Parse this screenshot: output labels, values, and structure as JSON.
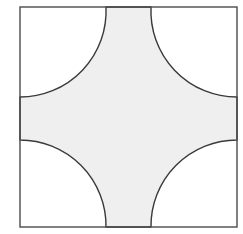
{
  "figure": {
    "title": "Square with four corner quarter-circle arcs",
    "background_color": "#ffffff",
    "shaded_fill_color": "#efefef",
    "stroke_color": "#3a3a3a",
    "frame_stroke_color": "#4a4a4a",
    "stroke_width": 1.4,
    "frame_stroke_width": 1.4,
    "square": {
      "left": 20,
      "top": 7,
      "right": 237,
      "bottom": 227,
      "width": 217,
      "height": 220,
      "label": "bounding-square"
    },
    "arcs": [
      {
        "name": "top-left-arc",
        "center_x": 20,
        "center_y": 7,
        "radius": 86,
        "start_x": 106,
        "start_y": 7,
        "end_x": 20,
        "end_y": 97
      },
      {
        "name": "top-right-arc",
        "center_x": 237,
        "center_y": 7,
        "radius": 86,
        "start_x": 151,
        "start_y": 7,
        "end_x": 237,
        "end_y": 97
      },
      {
        "name": "bottom-right-arc",
        "center_x": 237,
        "center_y": 227,
        "radius": 86,
        "start_x": 237,
        "start_y": 140,
        "end_x": 151,
        "end_y": 227
      },
      {
        "name": "bottom-left-arc",
        "center_x": 20,
        "center_y": 227,
        "radius": 86,
        "start_x": 106,
        "start_y": 227,
        "end_x": 20,
        "end_y": 140
      }
    ],
    "tangent_bands": {
      "top": {
        "from_x": 106,
        "to_x": 151,
        "y": 7
      },
      "bottom": {
        "from_x": 106,
        "to_x": 151,
        "y": 227
      },
      "left": {
        "from_y": 97,
        "to_y": 140,
        "x": 20
      },
      "right": {
        "from_y": 97,
        "to_y": 140,
        "x": 237
      }
    },
    "shaded_path": "M 106 7 L 151 7 A 86 86 0 0 0 237 97 L 237 140 A 86 86 0 0 0 151 227 L 106 227 A 86 86 0 0 0 20 140 L 20 97 A 86 86 0 0 0 106 7 Z"
  }
}
